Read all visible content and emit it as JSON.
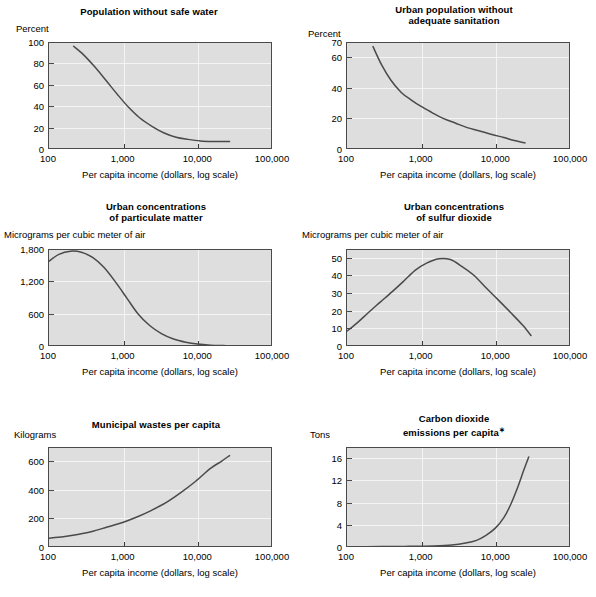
{
  "figure": {
    "x_caption": "Per capita income (dollars, log scale)",
    "x_ticks": [
      "100",
      "1,000",
      "10,000",
      "100,000"
    ],
    "x_tick_values": [
      100,
      1000,
      10000,
      100000
    ],
    "plot_bg": "#dedede",
    "grid_color": "#f4f4f4",
    "curve_color": "#4a4a4a",
    "axis_color": "#4a4a4a",
    "footnote_mark": "∗"
  },
  "chart_data": [
    {
      "id": "population-without-safe-water",
      "type": "line",
      "title": "Population without safe water",
      "title_lines": [
        "Population without safe water"
      ],
      "ylabel": "Percent",
      "xlabel": "Per capita income (dollars, log scale)",
      "xscale": "log",
      "xlim": [
        100,
        100000
      ],
      "ylim": [
        0,
        100
      ],
      "yticks": [
        0,
        20,
        40,
        60,
        80,
        100
      ],
      "ytick_labels": [
        "0",
        "20",
        "40",
        "60",
        "80",
        "100"
      ],
      "gridlines_y": [
        20,
        40,
        60,
        80
      ],
      "grid": true,
      "legend": "none",
      "x": [
        220,
        300,
        420,
        600,
        850,
        1200,
        1700,
        2500,
        3600,
        5200,
        7500,
        11000,
        16000,
        22000,
        27000
      ],
      "y": [
        96,
        88,
        77,
        64,
        51,
        39,
        29,
        21,
        15,
        11,
        9,
        7.5,
        7,
        7,
        7
      ]
    },
    {
      "id": "urban-population-without-adequate-sanitation",
      "type": "line",
      "title": "Urban population without adequate sanitation",
      "title_lines": [
        "Urban population without",
        "adequate sanitation"
      ],
      "ylabel": "Percent",
      "xlabel": "Per capita income (dollars, log scale)",
      "xscale": "log",
      "xlim": [
        100,
        100000
      ],
      "ylim": [
        0,
        70
      ],
      "yticks": [
        0,
        20,
        40,
        60,
        70
      ],
      "ytick_labels": [
        "0",
        "20",
        "40",
        "60",
        "70"
      ],
      "gridlines_y": [
        20,
        40,
        60
      ],
      "grid": true,
      "legend": "none",
      "x": [
        230,
        300,
        400,
        550,
        750,
        1000,
        1400,
        2000,
        2900,
        4200,
        6000,
        9000,
        13000,
        18000,
        25000
      ],
      "y": [
        67,
        55,
        45,
        37,
        32,
        28,
        24,
        20,
        17,
        14,
        12,
        9.5,
        7.5,
        5.5,
        4
      ]
    },
    {
      "id": "urban-concentrations-of-particulate-matter",
      "type": "line",
      "title": "Urban concentrations of particulate matter",
      "title_lines": [
        "Urban concentrations",
        "of particulate matter"
      ],
      "ylabel": "Micrograms per cubic meter of air",
      "xlabel": "Per capita income (dollars, log scale)",
      "xscale": "log",
      "xlim": [
        100,
        100000
      ],
      "ylim": [
        0,
        1800
      ],
      "yticks": [
        0,
        600,
        1200,
        1800
      ],
      "ytick_labels": [
        "0",
        "600",
        "1,200",
        "1,800"
      ],
      "gridlines_y": [
        600,
        1200
      ],
      "grid": true,
      "legend": "none",
      "x": [
        100,
        140,
        200,
        280,
        400,
        560,
        800,
        1150,
        1600,
        2300,
        3300,
        4800,
        7000,
        10000,
        15000,
        22000,
        31000
      ],
      "y": [
        1560,
        1700,
        1760,
        1740,
        1640,
        1460,
        1190,
        880,
        600,
        380,
        230,
        130,
        70,
        35,
        15,
        8,
        5
      ]
    },
    {
      "id": "urban-concentrations-of-sulfur-dioxide",
      "type": "line",
      "title": "Urban concentrations of sulfur dioxide",
      "title_lines": [
        "Urban concentrations",
        "of sulfur dioxide"
      ],
      "ylabel": "Micrograms per cubic meter of air",
      "xlabel": "Per capita income (dollars, log scale)",
      "xscale": "log",
      "xlim": [
        100,
        100000
      ],
      "ylim": [
        0,
        55
      ],
      "yticks": [
        0,
        10,
        20,
        30,
        40,
        50
      ],
      "ytick_labels": [
        "0",
        "10",
        "20",
        "30",
        "40",
        "50"
      ],
      "gridlines_y": [
        10,
        20,
        30,
        40,
        50
      ],
      "grid": true,
      "legend": "none",
      "x": [
        100,
        140,
        200,
        290,
        420,
        600,
        850,
        1200,
        1750,
        2500,
        3600,
        5200,
        7500,
        11000,
        16000,
        23000,
        30000
      ],
      "y": [
        8,
        13,
        19,
        25,
        31,
        37,
        43,
        47,
        49.5,
        49,
        45,
        40,
        33,
        26,
        19,
        12,
        6
      ]
    },
    {
      "id": "municipal-wastes-per-capita",
      "type": "line",
      "title": "Municipal wastes per capita",
      "title_lines": [
        "Municipal wastes per capita"
      ],
      "ylabel": "Kilograms",
      "xlabel": "Per capita income (dollars, log scale)",
      "xscale": "log",
      "xlim": [
        100,
        100000
      ],
      "ylim": [
        0,
        700
      ],
      "yticks": [
        0,
        200,
        400,
        600
      ],
      "ytick_labels": [
        "0",
        "200",
        "400",
        "600"
      ],
      "gridlines_y": [
        200,
        400,
        600
      ],
      "grid": true,
      "legend": "none",
      "x": [
        100,
        160,
        250,
        400,
        620,
        1000,
        1550,
        2400,
        3800,
        6000,
        9500,
        15000,
        21000,
        27000
      ],
      "y": [
        62,
        72,
        88,
        110,
        140,
        172,
        210,
        255,
        310,
        380,
        460,
        550,
        600,
        640
      ]
    },
    {
      "id": "carbon-dioxide-emissions-per-capita",
      "type": "line",
      "title": "Carbon dioxide emissions per capita",
      "title_lines": [
        "Carbon dioxide",
        "emissions per capita"
      ],
      "ylabel": "Tons",
      "xlabel": "Per capita income (dollars, log scale)",
      "xscale": "log",
      "xlim": [
        100,
        100000
      ],
      "ylim": [
        0,
        18
      ],
      "yticks": [
        0,
        4,
        8,
        12,
        16
      ],
      "ytick_labels": [
        "0",
        "4",
        "8",
        "12",
        "16"
      ],
      "gridlines_y": [
        4,
        8,
        12,
        16
      ],
      "grid": true,
      "legend": "none",
      "has_footnote_mark": true,
      "x": [
        100,
        300,
        700,
        1500,
        2600,
        4000,
        5600,
        7500,
        10000,
        13000,
        16000,
        20000,
        24000,
        28000
      ],
      "y": [
        0.05,
        0.08,
        0.12,
        0.2,
        0.35,
        0.7,
        1.2,
        2.1,
        3.4,
        5.3,
        7.6,
        10.8,
        13.8,
        16.2
      ]
    }
  ]
}
